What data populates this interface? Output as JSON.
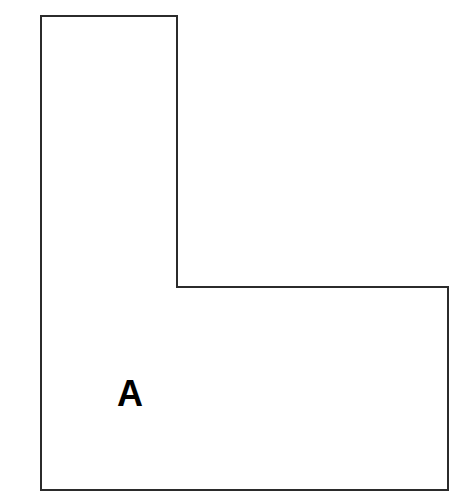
{
  "figure": {
    "background_color": "#ffffff",
    "width": 473,
    "height": 503
  },
  "shape": {
    "name": "L-shape",
    "type": "polygon",
    "sides": 6,
    "stroke_color": "#2b2b2b",
    "fill_color": "#ffffff",
    "stroke_width": 2,
    "points": "41,16 177,16 177,287 448,287 448,490 41,490",
    "vertices": [
      {
        "x": 41,
        "y": 16,
        "name": "top-left"
      },
      {
        "x": 177,
        "y": 16,
        "name": "top-right-of-upper-arm"
      },
      {
        "x": 177,
        "y": 287,
        "name": "inner-corner-top"
      },
      {
        "x": 448,
        "y": 287,
        "name": "right-top"
      },
      {
        "x": 448,
        "y": 490,
        "name": "bottom-right"
      },
      {
        "x": 41,
        "y": 490,
        "name": "bottom-left"
      }
    ]
  },
  "labels": {
    "region_a": {
      "text": "A",
      "x": 117,
      "y": 376,
      "font_size": 36,
      "color": "#000000"
    }
  }
}
